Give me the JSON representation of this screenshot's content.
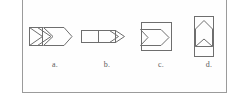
{
  "panel": {
    "border_color": "#9b9b9b",
    "background_color": "#fefefe",
    "stroke_color": "#6e6e6e",
    "label_color": "#5c5c5c"
  },
  "figures": [
    {
      "id": "figure-a",
      "label": "a.",
      "description": "square with inner chevron, followed by a chevron and a large arrow outline pointing right",
      "direction": "right"
    },
    {
      "id": "figure-b",
      "label": "b.",
      "description": "horizontal rectangle split by a vertical line with double chevrons pointing right",
      "direction": "right"
    },
    {
      "id": "figure-c",
      "label": "c.",
      "description": "square frame containing a concave arrow outline pointing right",
      "direction": "right"
    },
    {
      "id": "figure-d",
      "label": "d.",
      "description": "vertical rectangle containing an arrow outline pointing up with a chevron below",
      "direction": "up"
    }
  ]
}
